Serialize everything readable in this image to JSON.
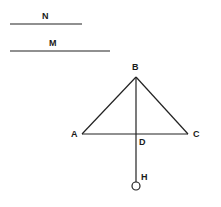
{
  "diagram": {
    "segments": {
      "N": {
        "label": "N",
        "x1": 10,
        "y1": 24,
        "x2": 82,
        "y2": 24
      },
      "M": {
        "label": "M",
        "x1": 10,
        "y1": 51,
        "x2": 110,
        "y2": 51
      }
    },
    "points": {
      "A": {
        "label": "A",
        "x": 82,
        "y": 134
      },
      "B": {
        "label": "B",
        "x": 136,
        "y": 77
      },
      "C": {
        "label": "C",
        "x": 188,
        "y": 134
      },
      "D": {
        "label": "D",
        "x": 136,
        "y": 134
      },
      "H": {
        "label": "H",
        "x": 136,
        "y": 186
      }
    },
    "colors": {
      "stroke": "#222222",
      "text": "#1a1a1a",
      "background": "#ffffff"
    }
  }
}
